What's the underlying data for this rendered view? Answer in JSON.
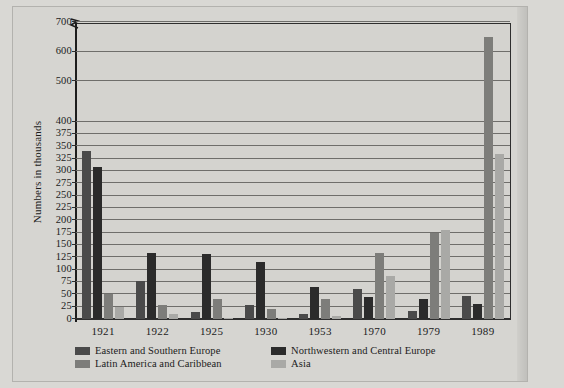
{
  "chart_data": {
    "type": "bar",
    "title": "",
    "xlabel": "",
    "ylabel": "Numbers in thousands",
    "grid": true,
    "legend_position": "bottom-left",
    "axis_break": {
      "present": true,
      "between": [
        400,
        500
      ]
    },
    "ylim": [
      0,
      700
    ],
    "ytick_labels": [
      "0",
      "25",
      "50",
      "75",
      "100",
      "125",
      "150",
      "175",
      "200",
      "225",
      "250",
      "275",
      "300",
      "325",
      "350",
      "375",
      "400",
      "500",
      "600",
      "700"
    ],
    "ytick_values": [
      0,
      25,
      50,
      75,
      100,
      125,
      150,
      175,
      200,
      225,
      250,
      275,
      300,
      325,
      350,
      375,
      400,
      500,
      600,
      700
    ],
    "categories": [
      "1921",
      "1922",
      "1925",
      "1930",
      "1953",
      "1970",
      "1979",
      "1989"
    ],
    "series": [
      {
        "name": "Eastern and Southern Europe",
        "color": "#4a4a4a",
        "values": [
          340,
          77,
          14,
          29,
          11,
          61,
          17,
          47
        ]
      },
      {
        "name": "Northwestern and Central Europe",
        "color": "#2b2b2b",
        "values": [
          308,
          134,
          131,
          116,
          65,
          45,
          41,
          30
        ]
      },
      {
        "name": "Latin America and Caribbean",
        "color": "#7d7d7a",
        "values": [
          50,
          29,
          41,
          21,
          41,
          134,
          174,
          650
        ]
      },
      {
        "name": "Asia",
        "color": "#a9a9a6",
        "values": [
          24,
          11,
          2,
          3,
          7,
          87,
          181,
          335
        ]
      }
    ]
  },
  "legend": {
    "items": [
      {
        "label": "Eastern and Southern Europe"
      },
      {
        "label": "Northwestern and Central Europe"
      },
      {
        "label": "Latin America and Caribbean"
      },
      {
        "label": "Asia"
      }
    ]
  }
}
